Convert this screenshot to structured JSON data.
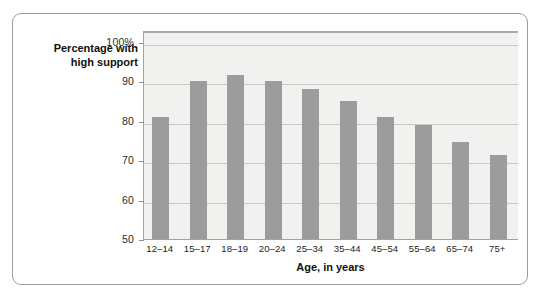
{
  "chart_data": {
    "type": "bar",
    "title": "",
    "subtitle": "",
    "xlabel": "Age, in years",
    "ylabel": "Percentage with high support",
    "categories": [
      "12–14",
      "15–17",
      "18–19",
      "20–24",
      "25–34",
      "35–44",
      "45–54",
      "55–64",
      "65–74",
      "75+"
    ],
    "values": [
      81,
      90,
      91.5,
      90,
      88,
      85,
      81,
      79,
      74.5,
      71.3
    ],
    "ylim": [
      50,
      103
    ],
    "ytick_values": [
      50,
      60,
      70,
      80,
      90,
      100
    ],
    "ytick_labels": [
      "50",
      "60",
      "70",
      "80",
      "90",
      "100%"
    ],
    "grid": true,
    "gridlines_at": [
      60,
      70,
      80,
      90,
      100
    ],
    "legend": "none",
    "bar_color": "#9c9c9c",
    "plot_background": "#f1f1ef",
    "gridline_color": "#c9c9c6",
    "frame_color": "#9d9d9d",
    "text_color": "#111111"
  },
  "axes": {
    "y_label_line1": "Percentage with",
    "y_label_line2": "high support",
    "x_title": "Age, in years"
  }
}
